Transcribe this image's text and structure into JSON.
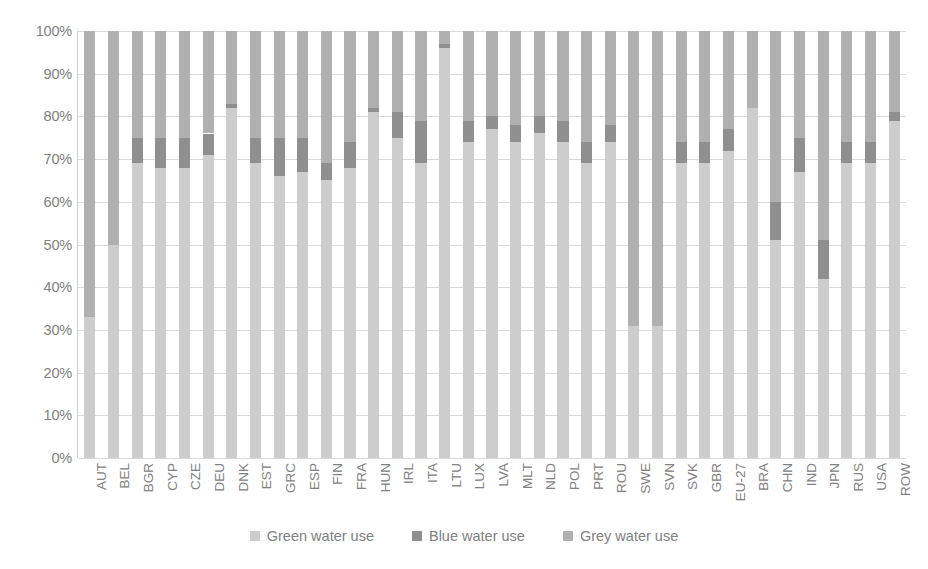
{
  "chart_data": {
    "type": "bar",
    "subtype": "stacked-100-percent",
    "title": "",
    "subtitle": "",
    "xlabel": "",
    "ylabel": "",
    "ylim": [
      0,
      100
    ],
    "y_unit": "%",
    "grid": true,
    "legend_position": "bottom",
    "y_ticks": [
      "0%",
      "10%",
      "20%",
      "30%",
      "40%",
      "50%",
      "60%",
      "70%",
      "80%",
      "90%",
      "100%"
    ],
    "y_tick_values": [
      0,
      10,
      20,
      30,
      40,
      50,
      60,
      70,
      80,
      90,
      100
    ],
    "categories": [
      "AUT",
      "BEL",
      "BGR",
      "CYP",
      "CZE",
      "DEU",
      "DNK",
      "EST",
      "GRC",
      "ESP",
      "FIN",
      "FRA",
      "HUN",
      "IRL",
      "ITA",
      "LTU",
      "LUX",
      "LVA",
      "MLT",
      "NLD",
      "POL",
      "PRT",
      "ROU",
      "SWE",
      "SVN",
      "SVK",
      "GBR",
      "EU-27",
      "BRA",
      "CHN",
      "IND",
      "JPN",
      "RUS",
      "USA",
      "ROW"
    ],
    "series": [
      {
        "name": "Green water use",
        "color": "#cdcdcd",
        "values": [
          33,
          50,
          69,
          68,
          68,
          71,
          82,
          69,
          66,
          67,
          65,
          68,
          81,
          75,
          69,
          96,
          74,
          77,
          74,
          76,
          74,
          69,
          74,
          31,
          31,
          69,
          69,
          72,
          82,
          51,
          67,
          42,
          69,
          69,
          79
        ]
      },
      {
        "name": "Blue water use",
        "color": "#8f8f8f",
        "values": [
          0,
          0,
          6,
          7,
          7,
          5,
          1,
          6,
          9,
          8,
          4,
          6,
          1,
          6,
          10,
          1,
          5,
          3,
          4,
          4,
          5,
          5,
          4,
          0,
          0,
          5,
          5,
          5,
          0,
          9,
          8,
          9,
          5,
          5,
          2
        ]
      },
      {
        "name": "Grey water use",
        "color": "#b0b0b0",
        "values": [
          67,
          50,
          25,
          25,
          25,
          24,
          17,
          25,
          25,
          25,
          31,
          26,
          18,
          19,
          21,
          3,
          21,
          20,
          22,
          20,
          21,
          26,
          22,
          69,
          69,
          26,
          26,
          23,
          18,
          40,
          25,
          49,
          26,
          26,
          19
        ]
      }
    ]
  },
  "legend": {
    "items": [
      {
        "label": "Green water use",
        "color": "#cdcdcd",
        "swatch_name": "legend-swatch-green"
      },
      {
        "label": "Blue water use",
        "color": "#8f8f8f",
        "swatch_name": "legend-swatch-blue"
      },
      {
        "label": "Grey water use",
        "color": "#b0b0b0",
        "swatch_name": "legend-swatch-grey"
      }
    ]
  },
  "colors": {
    "green_water": "#cdcdcd",
    "blue_water": "#8f8f8f",
    "grey_water": "#b0b0b0",
    "gridline": "#d9d9d9",
    "text": "#808080",
    "background": "#ffffff"
  }
}
